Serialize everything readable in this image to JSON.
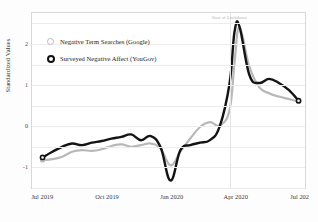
{
  "chart_data": {
    "type": "line",
    "title": "",
    "subtitle": "",
    "xlabel": "",
    "ylabel": "Standardized Values",
    "xlim": [
      "2019-06-15",
      "2020-07-10"
    ],
    "ylim": [
      -1.55,
      2.75
    ],
    "grid": true,
    "legend_position": "top-left",
    "yticks": [
      2,
      1,
      0,
      -1
    ],
    "ytick_labels": [
      "2",
      "1",
      "0",
      "-1"
    ],
    "xticks": [
      "Jul 2019",
      "Oct 2019",
      "Jan 2020",
      "Apr 2020",
      "Jul 202"
    ],
    "annotations": [
      {
        "label": "Start of Lockdown",
        "x": "2020-03-23",
        "type": "vertical-rule"
      }
    ],
    "series": [
      {
        "name": "Negative Term Searches (Google)",
        "color": "#b8b8b8",
        "marker": "open-circle",
        "x": [
          "2019-06-30",
          "2019-07-14",
          "2019-07-28",
          "2019-08-11",
          "2019-08-25",
          "2019-09-08",
          "2019-09-22",
          "2019-10-06",
          "2019-10-20",
          "2019-11-03",
          "2019-11-17",
          "2019-12-01",
          "2019-12-15",
          "2019-12-29",
          "2020-01-12",
          "2020-01-26",
          "2020-02-09",
          "2020-02-23",
          "2020-03-08",
          "2020-03-22",
          "2020-03-29",
          "2020-04-05",
          "2020-04-19",
          "2020-05-03",
          "2020-05-17",
          "2020-05-31",
          "2020-06-14",
          "2020-06-28"
        ],
        "values": [
          -0.82,
          -0.8,
          -0.74,
          -0.62,
          -0.58,
          -0.6,
          -0.56,
          -0.48,
          -0.44,
          -0.5,
          -0.46,
          -0.42,
          -0.55,
          -0.95,
          -0.62,
          -0.3,
          -0.02,
          0.1,
          0.02,
          0.4,
          1.55,
          2.4,
          1.45,
          0.95,
          0.8,
          0.72,
          0.66,
          0.6
        ]
      },
      {
        "name": "Surveyed Negative Affect (YouGov)",
        "color": "#141414",
        "marker": "open-circle",
        "x": [
          "2019-06-30",
          "2019-07-14",
          "2019-07-28",
          "2019-08-11",
          "2019-08-25",
          "2019-09-08",
          "2019-09-22",
          "2019-10-06",
          "2019-10-20",
          "2019-11-03",
          "2019-11-17",
          "2019-12-01",
          "2019-12-15",
          "2019-12-29",
          "2020-01-12",
          "2020-01-26",
          "2020-02-09",
          "2020-02-23",
          "2020-03-08",
          "2020-03-22",
          "2020-03-29",
          "2020-04-05",
          "2020-04-19",
          "2020-05-03",
          "2020-05-17",
          "2020-05-31",
          "2020-06-14",
          "2020-06-28"
        ],
        "values": [
          -0.76,
          -0.62,
          -0.5,
          -0.42,
          -0.46,
          -0.4,
          -0.36,
          -0.3,
          -0.26,
          -0.2,
          -0.34,
          -0.24,
          -0.52,
          -1.32,
          -0.58,
          -0.46,
          -0.4,
          -0.34,
          0.0,
          1.05,
          2.3,
          2.42,
          1.25,
          1.05,
          1.15,
          1.05,
          0.88,
          0.62
        ]
      }
    ]
  },
  "legend": {
    "items": [
      {
        "label": "Negative Term Searches (Google)",
        "marker_class": "google"
      },
      {
        "label": "Surveyed Negative Affect (YouGov)",
        "marker_class": "yougov"
      }
    ]
  }
}
